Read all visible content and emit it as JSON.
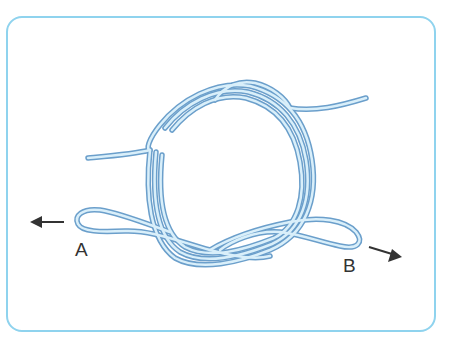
{
  "diagram": {
    "labels": {
      "a": "A",
      "b": "B"
    },
    "arrows": [
      {
        "name": "pull-left",
        "at": "A",
        "direction": "left"
      },
      {
        "name": "pull-right",
        "at": "B",
        "direction": "down-right"
      }
    ],
    "colors": {
      "frame": "#8fd3ee",
      "rope_outline": "#6b9fcb",
      "rope_fill": "#d9effa",
      "arrow": "#333333"
    }
  }
}
